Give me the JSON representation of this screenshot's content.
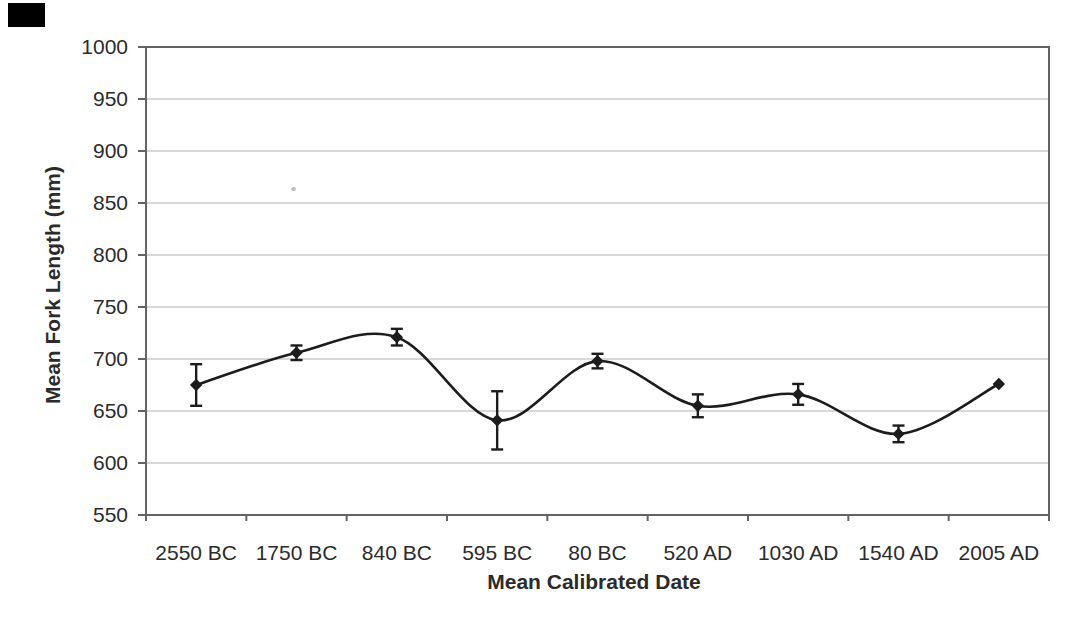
{
  "chart_data": {
    "type": "line",
    "title": "",
    "xlabel": "Mean Calibrated Date",
    "ylabel": "Mean Fork Length (mm)",
    "categories": [
      "2550 BC",
      "1750 BC",
      "840 BC",
      "595 BC",
      "80 BC",
      "520 AD",
      "1030 AD",
      "1540 AD",
      "2005 AD"
    ],
    "series": [
      {
        "values": [
          675,
          706,
          721,
          641,
          698,
          655,
          666,
          628,
          676
        ],
        "error_bars": [
          20,
          7,
          8,
          28,
          7,
          11,
          10,
          8,
          0
        ]
      }
    ],
    "ylim": [
      550,
      1000
    ],
    "ytick_step": 50,
    "yticks": [
      550,
      600,
      650,
      700,
      750,
      800,
      850,
      900,
      950,
      1000
    ],
    "grid": "horizontal",
    "legend": false,
    "marker": "diamond",
    "line_style": "smooth",
    "colors": {
      "series": "#1c1c1c",
      "grid": "#b2b2b2",
      "frame": "#636363",
      "text": "#2b2b2b"
    }
  }
}
